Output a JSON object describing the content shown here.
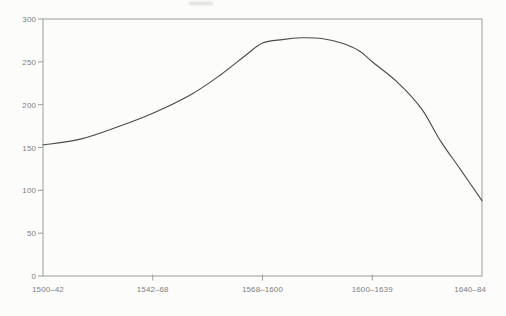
{
  "figure": {
    "title": "",
    "background": "#fcfcfb"
  },
  "chart_data": {
    "type": "line",
    "title": "",
    "xlabel": "",
    "ylabel": "",
    "categories": [
      "1500–42",
      "1542–68",
      "1568–1600",
      "1600–1639",
      "1640–84"
    ],
    "values": [
      153,
      190,
      272,
      250,
      88
    ],
    "peak_value": 278,
    "ylim": [
      0,
      300
    ],
    "yticks": [
      0,
      50,
      100,
      150,
      200,
      250,
      300
    ],
    "grid": false,
    "frame": "box",
    "legend_position": "none",
    "series_count": 1,
    "smooth_points": [
      [
        0.0,
        153
      ],
      [
        0.35,
        160
      ],
      [
        0.7,
        175
      ],
      [
        1.0,
        190
      ],
      [
        1.35,
        212
      ],
      [
        1.62,
        235
      ],
      [
        1.85,
        258
      ],
      [
        2.0,
        272
      ],
      [
        2.18,
        276
      ],
      [
        2.36,
        278
      ],
      [
        2.55,
        277
      ],
      [
        2.72,
        272
      ],
      [
        2.88,
        263
      ],
      [
        3.0,
        250
      ],
      [
        3.24,
        225
      ],
      [
        3.45,
        195
      ],
      [
        3.62,
        158
      ],
      [
        3.8,
        125
      ],
      [
        4.0,
        88
      ]
    ],
    "colors": {
      "line": "#4a4a4a",
      "axis": "#9c9c9c",
      "labels": "#7e7e7e"
    }
  }
}
